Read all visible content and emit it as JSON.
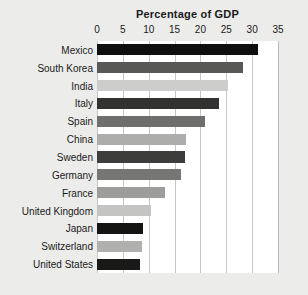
{
  "chart_data": {
    "type": "bar",
    "orientation": "horizontal",
    "title": "Percentage of GDP",
    "xlabel": "",
    "ylabel": "",
    "xlim": [
      0,
      35
    ],
    "ylim": null,
    "grid": true,
    "legend": false,
    "xticks": [
      0,
      5,
      10,
      15,
      20,
      25,
      30,
      35
    ],
    "xtick_labels": [
      "0",
      "5",
      "10",
      "15",
      "20",
      "25",
      "30",
      "35"
    ],
    "categories": [
      "Mexico",
      "South Korea",
      "India",
      "Italy",
      "Spain",
      "China",
      "Sweden",
      "Germany",
      "France",
      "United Kingdom",
      "Japan",
      "Switzerland",
      "United States"
    ],
    "values": [
      31.2,
      28.2,
      25.3,
      23.6,
      20.9,
      17.3,
      17.0,
      16.2,
      13.2,
      10.5,
      8.9,
      8.7,
      8.3
    ],
    "bar_colors": [
      "#100f0f",
      "#585857",
      "#cdcdcc",
      "#323231",
      "#6e6e6d",
      "#adadac",
      "#3d3d3c",
      "#767675",
      "#9d9d9c",
      "#c4c4c3",
      "#141413",
      "#b0b0af",
      "#191918"
    ]
  },
  "figure": {
    "background_color": "#ececeb",
    "plot_background_color": "#ffffff",
    "gridline_color": "#c6c6c6",
    "text_color": "#1a1a1a"
  }
}
